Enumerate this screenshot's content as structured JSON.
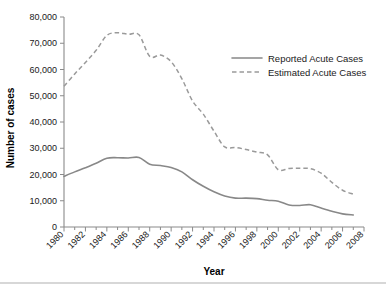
{
  "chart_data": {
    "type": "line",
    "title": "",
    "xlabel": "Year",
    "ylabel": "Number of cases",
    "xlim": [
      1980,
      2008
    ],
    "ylim": [
      0,
      80000
    ],
    "grid": false,
    "legend_position": "top-right",
    "y_ticks": [
      0,
      10000,
      20000,
      30000,
      40000,
      50000,
      60000,
      70000,
      80000
    ],
    "y_tick_labels": [
      "0",
      "10,000",
      "20,000",
      "30,000",
      "40,000",
      "50,000",
      "60,000",
      "70,000",
      "80,000"
    ],
    "x_ticks": [
      1980,
      1982,
      1984,
      1986,
      1988,
      1990,
      1992,
      1994,
      1996,
      1998,
      2000,
      2002,
      2004,
      2006,
      2008
    ],
    "x_tick_labels": [
      "1980",
      "1982",
      "1984",
      "1986",
      "1988",
      "1990",
      "1992",
      "1994",
      "1996",
      "1998",
      "2000",
      "2002",
      "2004",
      "2006",
      "2008"
    ],
    "x_minor_ticks": [
      1981,
      1983,
      1985,
      1987,
      1989,
      1991,
      1993,
      1995,
      1997,
      1999,
      2001,
      2003,
      2005,
      2007
    ],
    "x": [
      1980,
      1981,
      1982,
      1983,
      1984,
      1985,
      1986,
      1987,
      1988,
      1989,
      1990,
      1991,
      1992,
      1993,
      1994,
      1995,
      1996,
      1997,
      1998,
      1999,
      2000,
      2001,
      2002,
      2003,
      2004,
      2005,
      2006,
      2007
    ],
    "series": [
      {
        "name": "Reported Acute Cases",
        "style": "solid",
        "color": "#888888",
        "values": [
          19300,
          21000,
          22600,
          24300,
          26200,
          26400,
          26300,
          26500,
          23900,
          23400,
          22700,
          21000,
          18000,
          15500,
          13400,
          11800,
          11000,
          11000,
          10800,
          10200,
          9800,
          8400,
          8200,
          8500,
          7200,
          6000,
          5000,
          4600
        ]
      },
      {
        "name": "Estimated Acute Cases",
        "style": "dashed",
        "color": "#9a9a9a",
        "values": [
          53600,
          58300,
          62700,
          67300,
          73000,
          74000,
          73400,
          73200,
          65000,
          65500,
          63000,
          56500,
          48000,
          43000,
          36500,
          30500,
          30300,
          29500,
          28500,
          27500,
          21800,
          22300,
          22400,
          22200,
          20500,
          17000,
          14000,
          12500
        ]
      }
    ]
  },
  "legend": {
    "items": [
      {
        "label": "Reported Acute Cases",
        "style": "solid"
      },
      {
        "label": "Estimated Acute Cases",
        "style": "dashed"
      }
    ]
  },
  "axes": {
    "y_title": "Number of cases",
    "x_title": "Year"
  }
}
